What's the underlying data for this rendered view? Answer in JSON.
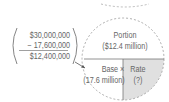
{
  "calculation": {
    "line1": "$30,000,000",
    "line2": "− 17,600,000",
    "line3": "$12,400,000"
  },
  "circle": {
    "top_label": "Portion",
    "top_value": "($12.4 million)",
    "bottom_left_label": "Base ×",
    "bottom_left_value": "(17.6 million)",
    "bottom_right_label": "Rate",
    "bottom_right_value": "(?)",
    "shaded_color": "#e0e0e0",
    "line_color": "#888888"
  }
}
